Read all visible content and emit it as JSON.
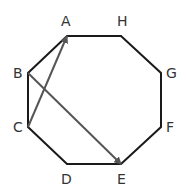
{
  "diagram": {
    "shape": "octagon",
    "vertices": [
      {
        "label": "A",
        "x": 67,
        "y": 36,
        "lx": 61,
        "ly": 26
      },
      {
        "label": "H",
        "x": 121,
        "y": 36,
        "lx": 117,
        "ly": 26
      },
      {
        "label": "G",
        "x": 161,
        "y": 73,
        "lx": 166,
        "ly": 78
      },
      {
        "label": "F",
        "x": 161,
        "y": 127,
        "lx": 166,
        "ly": 132
      },
      {
        "label": "E",
        "x": 121,
        "y": 164,
        "lx": 117,
        "ly": 184
      },
      {
        "label": "D",
        "x": 67,
        "y": 164,
        "lx": 61,
        "ly": 184
      },
      {
        "label": "C",
        "x": 28,
        "y": 127,
        "lx": 13,
        "ly": 132
      },
      {
        "label": "B",
        "x": 28,
        "y": 73,
        "lx": 13,
        "ly": 78
      }
    ],
    "arrows": [
      {
        "from": "C",
        "to": "A"
      },
      {
        "from": "B",
        "to": "E"
      }
    ],
    "colors": {
      "edge": "#1a1a1a",
      "arrow": "#555555",
      "label": "#333333"
    }
  }
}
